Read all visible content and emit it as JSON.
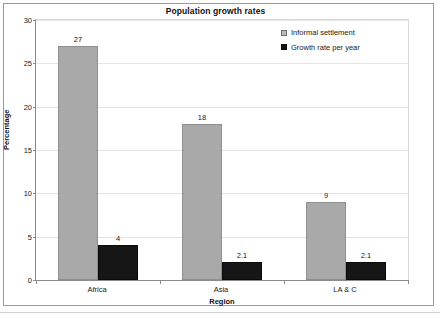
{
  "chart_data": {
    "type": "bar",
    "title": "Population growth rates",
    "xlabel": "Region",
    "ylabel": "Percentage",
    "categories": [
      "Africa",
      "Asia",
      "LA & C"
    ],
    "series": [
      {
        "name": "Informal settlement",
        "color": "#a9a9a9",
        "values": [
          27,
          18,
          9
        ],
        "labels": [
          "27",
          "18",
          "9"
        ]
      },
      {
        "name": "Growth rate per year",
        "color": "#161616",
        "values": [
          4,
          2.1,
          2.1
        ],
        "labels": [
          "4",
          "2.1",
          "2.1"
        ]
      }
    ],
    "ylim": [
      0,
      30
    ],
    "yticks": [
      0,
      5,
      10,
      15,
      20,
      25,
      30
    ],
    "ytick_labels": [
      "0",
      "5",
      "10",
      "15",
      "20",
      "25",
      "30"
    ],
    "grid": true,
    "legend_position": "upper-right-inside"
  }
}
